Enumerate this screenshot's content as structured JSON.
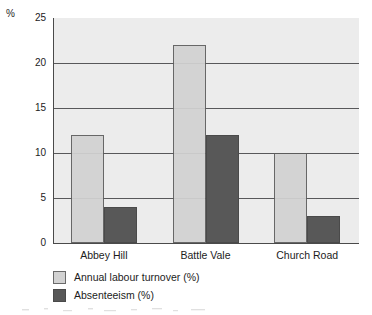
{
  "chart_data": {
    "type": "bar",
    "title": "",
    "subtitle": "",
    "xlabel": "",
    "ylabel": "%",
    "axis_unit_label": "%",
    "categories": [
      "Abbey Hill",
      "Battle Vale",
      "Church Road"
    ],
    "series": [
      {
        "name": "Annual labour turnover (%)",
        "values": [
          12,
          22,
          10
        ],
        "color": "#d2d2d2"
      },
      {
        "name": "Absenteeism (%)",
        "values": [
          4,
          12,
          3
        ],
        "color": "#585858"
      }
    ],
    "ylim": [
      0,
      25
    ],
    "ytick_values": [
      0,
      5,
      10,
      15,
      20,
      25
    ],
    "ytick_labels": [
      "0",
      "5",
      "10",
      "15",
      "20",
      "25"
    ],
    "grid": true,
    "grid_axis": "y",
    "legend_position": "bottom-left",
    "plot_background": "#ececec",
    "axis_color": "#4a4a4a",
    "gridline_color": "#58585a"
  }
}
